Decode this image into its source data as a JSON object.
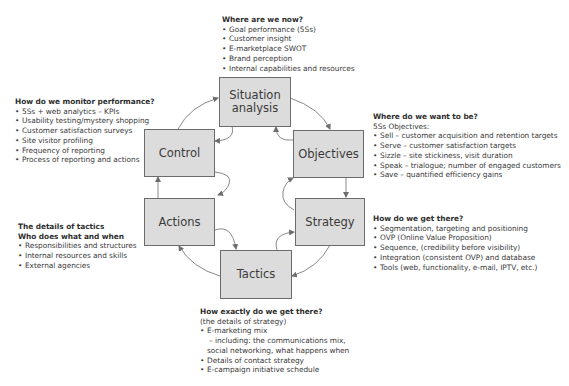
{
  "stages": {
    "situation": "Situation analysis",
    "objectives": "Objectives",
    "strategy": "Strategy",
    "tactics": "Tactics",
    "actions": "Actions",
    "control": "Control"
  },
  "situation_notes": {
    "heading": "Where are we now?",
    "items": [
      "Goal performance (5Ss)",
      "Customer insight",
      "E-marketplace SWOT",
      "Brand perception",
      "Internal capabilities and resources"
    ]
  },
  "objectives_notes": {
    "heading": "Where do we want to be?",
    "subheading": "5Ss Objectives:",
    "items": [
      "Sell – customer acquisition and retention targets",
      "Serve – customer satisfaction targets",
      "Sizzle – site stickiness, visit duration",
      "Speak – trialogue; number of engaged customers",
      "Save – quantified efficiency gains"
    ]
  },
  "strategy_notes": {
    "heading": "How do we get there?",
    "items": [
      "Segmentation, targeting and positioning",
      "OVP (Online Value Proposition)",
      "Sequence, (credibility before visibility)",
      "Integration (consistent OVP) and database",
      "Tools (web, functionality, e-mail, IPTV, etc.)"
    ]
  },
  "tactics_notes": {
    "heading": "How exactly do we get there?",
    "subheading": "(the details of strategy)",
    "items": [
      "E-marketing mix",
      "– including: the communications mix,",
      "social networking, what happens when",
      "Details of contact strategy",
      "E-campaign initiative schedule"
    ]
  },
  "actions_notes": {
    "heading": "The details of tactics",
    "heading2": "Who does what and when",
    "items": [
      "Responsibilities and structures",
      "Internal resources and skills",
      "External agencies"
    ]
  },
  "control_notes": {
    "heading": "How do we monitor performance?",
    "items": [
      "5Ss + web analytics – KPIs",
      "Usability testing/mystery shopping",
      "Customer satisfaction surveys",
      "Site visitor profiling",
      "Frequency of reporting",
      "Process of reporting and actions"
    ]
  },
  "colors": {
    "box_fill": "#dcdcdc",
    "box_border": "#6b6b6b",
    "arrow": "#6e6e6e"
  }
}
